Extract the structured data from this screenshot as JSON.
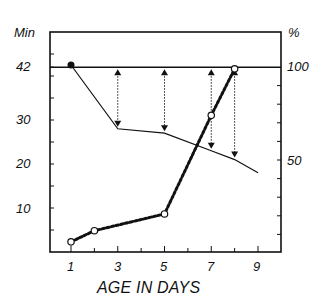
{
  "chart_data": {
    "type": "line",
    "title": "",
    "xlabel": "AGE IN DAYS",
    "ylabel_left": "Min",
    "ylabel_right": "%",
    "x_ticks": [
      1,
      3,
      5,
      7,
      9
    ],
    "y_left_ticks": [
      10,
      20,
      30,
      42
    ],
    "y_right_ticks": [
      50,
      100
    ],
    "xlim": [
      0.3,
      10
    ],
    "ylim_left": [
      0,
      49
    ],
    "ylim_right": [
      0,
      100
    ],
    "grid": false,
    "reference_line": {
      "y_left": 42,
      "y_right": 100,
      "label": "42 min / 100%"
    },
    "series": [
      {
        "name": "Time (Min)",
        "axis": "left",
        "style": "solid",
        "marker": "filled-triangle",
        "x": [
          1,
          3,
          5,
          7,
          8,
          9
        ],
        "values": [
          42.5,
          28,
          27,
          23,
          21,
          18
        ]
      },
      {
        "name": "Percent (%)",
        "axis": "right",
        "style": "dotted",
        "marker": "open-circle",
        "x": [
          1,
          2,
          5,
          7,
          8
        ],
        "values": [
          6,
          12,
          21,
          74,
          99
        ]
      }
    ],
    "annotations": [
      {
        "type": "double-arrow-dotted",
        "x": 3,
        "from_min": 42,
        "to_min": 28
      },
      {
        "type": "double-arrow-dotted",
        "x": 5,
        "from_min": 42,
        "to_min": 27
      },
      {
        "type": "double-arrow-dotted",
        "x": 7,
        "from_min": 42,
        "to_min": 23
      },
      {
        "type": "double-arrow-dotted",
        "x": 8,
        "from_min": 42,
        "to_min": 21
      }
    ]
  },
  "labels": {
    "left_unit": "Min",
    "right_unit": "%",
    "left_ticks": [
      "42",
      "30",
      "20",
      "10"
    ],
    "right_ticks": [
      "100",
      "50"
    ],
    "x_ticks": [
      "1",
      "3",
      "5",
      "7",
      "9"
    ],
    "x_title": "AGE IN DAYS"
  }
}
